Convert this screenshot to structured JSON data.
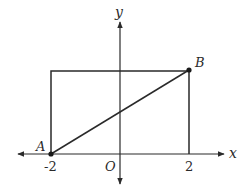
{
  "diagram": {
    "axes": {
      "x_label": "x",
      "y_label": "y",
      "origin_label": "O",
      "x_ticks": [
        "-2",
        "2"
      ]
    },
    "points": [
      {
        "name": "A",
        "coords": [
          -2,
          0
        ]
      },
      {
        "name": "B",
        "coords": [
          2,
          "h"
        ]
      }
    ],
    "rectangle": {
      "x_from": -2,
      "x_to": 2,
      "corners": [
        "(-2,0)",
        "(2,0)",
        "(2,h)",
        "(-2,h)"
      ]
    },
    "segment": {
      "from": "A",
      "to": "B"
    },
    "colors": {
      "line": "#2a2a2a",
      "background": "#ffffff"
    }
  }
}
